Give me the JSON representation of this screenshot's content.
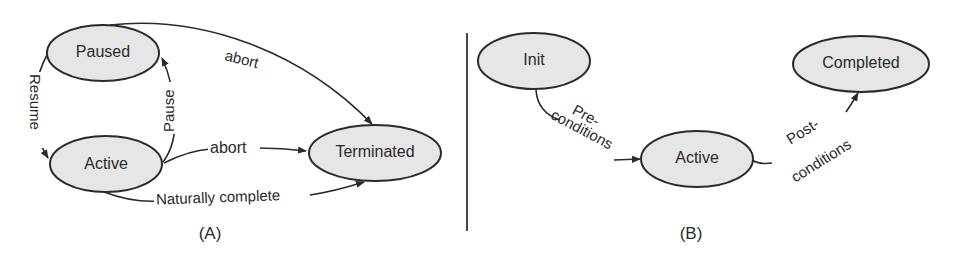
{
  "diagrams": [
    {
      "caption": "(A)",
      "nodes": [
        {
          "id": "paused",
          "label": "Paused"
        },
        {
          "id": "active",
          "label": "Active"
        },
        {
          "id": "terminated",
          "label": "Terminated"
        }
      ],
      "edges": [
        {
          "from": "paused",
          "to": "active",
          "label": "Resume"
        },
        {
          "from": "active",
          "to": "paused",
          "label": "Pause"
        },
        {
          "from": "paused",
          "to": "terminated",
          "label": "abort"
        },
        {
          "from": "active",
          "to": "terminated",
          "label": "abort"
        },
        {
          "from": "active",
          "to": "terminated",
          "label": "Naturally complete"
        }
      ]
    },
    {
      "caption": "(B)",
      "nodes": [
        {
          "id": "init",
          "label": "Init"
        },
        {
          "id": "active",
          "label": "Active"
        },
        {
          "id": "completed",
          "label": "Completed"
        }
      ],
      "edges": [
        {
          "from": "init",
          "to": "active",
          "label_line1": "Pre-",
          "label_line2": "conditions"
        },
        {
          "from": "active",
          "to": "completed",
          "label_line1": "Post-",
          "label_line2": "conditions"
        }
      ]
    }
  ],
  "colors": {
    "node_fill": "#e6e6e6",
    "stroke": "#2a2a2a",
    "background": "#ffffff"
  }
}
